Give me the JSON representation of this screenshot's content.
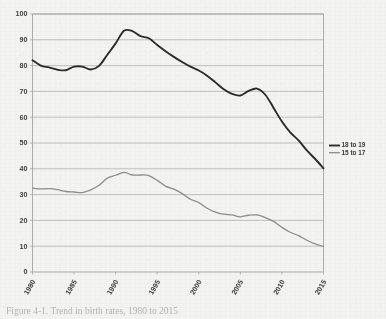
{
  "figure": {
    "caption": "Figure 4-1. Trend in birth rates, 1980 to 2015"
  },
  "legend": {
    "position": "right",
    "entries": [
      {
        "label": "18 to 19",
        "color": "#2b2b2b",
        "width": 1.9
      },
      {
        "label": "15 to 17",
        "color": "#8c8c8c",
        "width": 1.3
      }
    ]
  },
  "chart_data": {
    "type": "line",
    "title": "",
    "subtitle": "",
    "xlabel": "",
    "ylabel": "",
    "xlim": [
      1980,
      2015
    ],
    "ylim": [
      0,
      100
    ],
    "grid": true,
    "grid_axis": "y",
    "x_tick_labels": [
      "1980",
      "1985",
      "1990",
      "1995",
      "2000",
      "2005",
      "2010",
      "2015"
    ],
    "x_ticks": [
      1980,
      1985,
      1990,
      1995,
      2000,
      2005,
      2010,
      2015
    ],
    "x_tick_rotation": -60,
    "y_tick_labels": [
      "0",
      "10",
      "20",
      "30",
      "40",
      "50",
      "60",
      "70",
      "80",
      "90",
      "100"
    ],
    "y_ticks": [
      0,
      10,
      20,
      30,
      40,
      50,
      60,
      70,
      80,
      90,
      100
    ],
    "x": [
      1980,
      1981,
      1982,
      1983,
      1984,
      1985,
      1986,
      1987,
      1988,
      1989,
      1990,
      1991,
      1992,
      1993,
      1994,
      1995,
      1996,
      1997,
      1998,
      1999,
      2000,
      2001,
      2002,
      2003,
      2004,
      2005,
      2006,
      2007,
      2008,
      2009,
      2010,
      2011,
      2012,
      2013,
      2014,
      2015
    ],
    "series": [
      {
        "name": "18 to 19",
        "color": "#2b2b2b",
        "values": [
          82.1,
          80.0,
          79.3,
          78.4,
          78.2,
          79.6,
          79.6,
          78.5,
          79.9,
          84.2,
          88.6,
          93.5,
          93.4,
          91.4,
          90.6,
          88.0,
          85.6,
          83.4,
          81.4,
          79.6,
          78.1,
          76.1,
          73.5,
          70.8,
          69.0,
          68.4,
          70.2,
          71.1,
          68.7,
          63.6,
          58.3,
          54.1,
          51.0,
          47.1,
          43.8,
          40.2
        ]
      },
      {
        "name": "15 to 17",
        "color": "#8c8c8c",
        "values": [
          32.5,
          32.2,
          32.3,
          31.9,
          31.2,
          31.0,
          30.8,
          31.8,
          33.6,
          36.4,
          37.5,
          38.6,
          37.6,
          37.6,
          37.4,
          35.5,
          33.3,
          32.1,
          30.4,
          28.2,
          26.9,
          24.7,
          23.2,
          22.4,
          22.1,
          21.4,
          22.0,
          22.1,
          21.1,
          19.6,
          17.3,
          15.4,
          14.1,
          12.3,
          10.9,
          9.9
        ]
      }
    ],
    "annotations": []
  },
  "axes": {
    "frame_color": "#9a9a98",
    "gridline_color": "#a9a9a6",
    "background": "#f3f3f1"
  }
}
